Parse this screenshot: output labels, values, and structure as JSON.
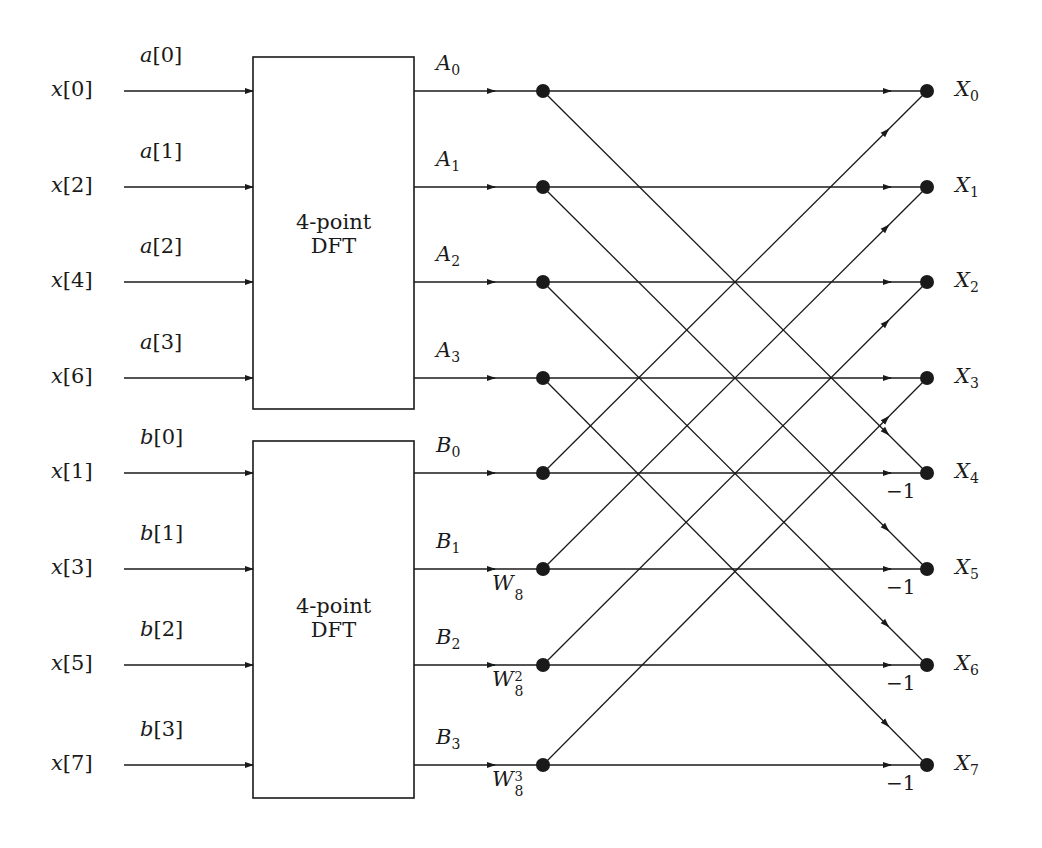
{
  "diagram": {
    "blocks": [
      {
        "id": "dft-top",
        "line1": "4-point",
        "line2": "DFT"
      },
      {
        "id": "dft-bottom",
        "line1": "4-point",
        "line2": "DFT"
      }
    ],
    "inputs": [
      {
        "name": "x",
        "index": "0",
        "seq": "a",
        "seq_index": "0"
      },
      {
        "name": "x",
        "index": "2",
        "seq": "a",
        "seq_index": "1"
      },
      {
        "name": "x",
        "index": "4",
        "seq": "a",
        "seq_index": "2"
      },
      {
        "name": "x",
        "index": "6",
        "seq": "a",
        "seq_index": "3"
      },
      {
        "name": "x",
        "index": "1",
        "seq": "b",
        "seq_index": "0"
      },
      {
        "name": "x",
        "index": "3",
        "seq": "b",
        "seq_index": "1"
      },
      {
        "name": "x",
        "index": "5",
        "seq": "b",
        "seq_index": "2"
      },
      {
        "name": "x",
        "index": "7",
        "seq": "b",
        "seq_index": "3"
      }
    ],
    "dft_outputs": [
      {
        "name": "A",
        "sub": "0"
      },
      {
        "name": "A",
        "sub": "1"
      },
      {
        "name": "A",
        "sub": "2"
      },
      {
        "name": "A",
        "sub": "3"
      },
      {
        "name": "B",
        "sub": "0"
      },
      {
        "name": "B",
        "sub": "1"
      },
      {
        "name": "B",
        "sub": "2"
      },
      {
        "name": "B",
        "sub": "3"
      }
    ],
    "twiddles": [
      {
        "row": 5,
        "base": "W",
        "sub": "8",
        "sup": ""
      },
      {
        "row": 6,
        "base": "W",
        "sub": "8",
        "sup": "2"
      },
      {
        "row": 7,
        "base": "W",
        "sub": "8",
        "sup": "3"
      }
    ],
    "outputs": [
      {
        "name": "X",
        "sub": "0"
      },
      {
        "name": "X",
        "sub": "1"
      },
      {
        "name": "X",
        "sub": "2"
      },
      {
        "name": "X",
        "sub": "3"
      },
      {
        "name": "X",
        "sub": "4"
      },
      {
        "name": "X",
        "sub": "5"
      },
      {
        "name": "X",
        "sub": "6"
      },
      {
        "name": "X",
        "sub": "7"
      }
    ],
    "negations": [
      {
        "row": 4,
        "label": "−1"
      },
      {
        "row": 5,
        "label": "−1"
      },
      {
        "row": 6,
        "label": "−1"
      },
      {
        "row": 7,
        "label": "−1"
      }
    ],
    "colors": {
      "line": "#1a1a1a",
      "background": "#ffffff"
    }
  }
}
